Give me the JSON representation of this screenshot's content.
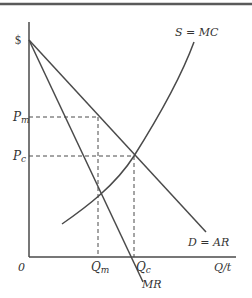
{
  "diagram": {
    "colors": {
      "line": "#4a4a4a",
      "border": "#5a5a5a",
      "text": "#333333"
    },
    "axes": {
      "y_label": "$",
      "x_label": "Q/t",
      "origin_label": "0"
    },
    "price_labels": {
      "monopoly": "P",
      "monopoly_sub": "m",
      "competitive": "P",
      "competitive_sub": "c"
    },
    "quantity_labels": {
      "monopoly": "Q",
      "monopoly_sub": "m",
      "competitive": "Q",
      "competitive_sub": "c"
    },
    "curves": {
      "supply": "S = MC",
      "demand": "D = AR",
      "marginal_revenue": "MR"
    }
  }
}
